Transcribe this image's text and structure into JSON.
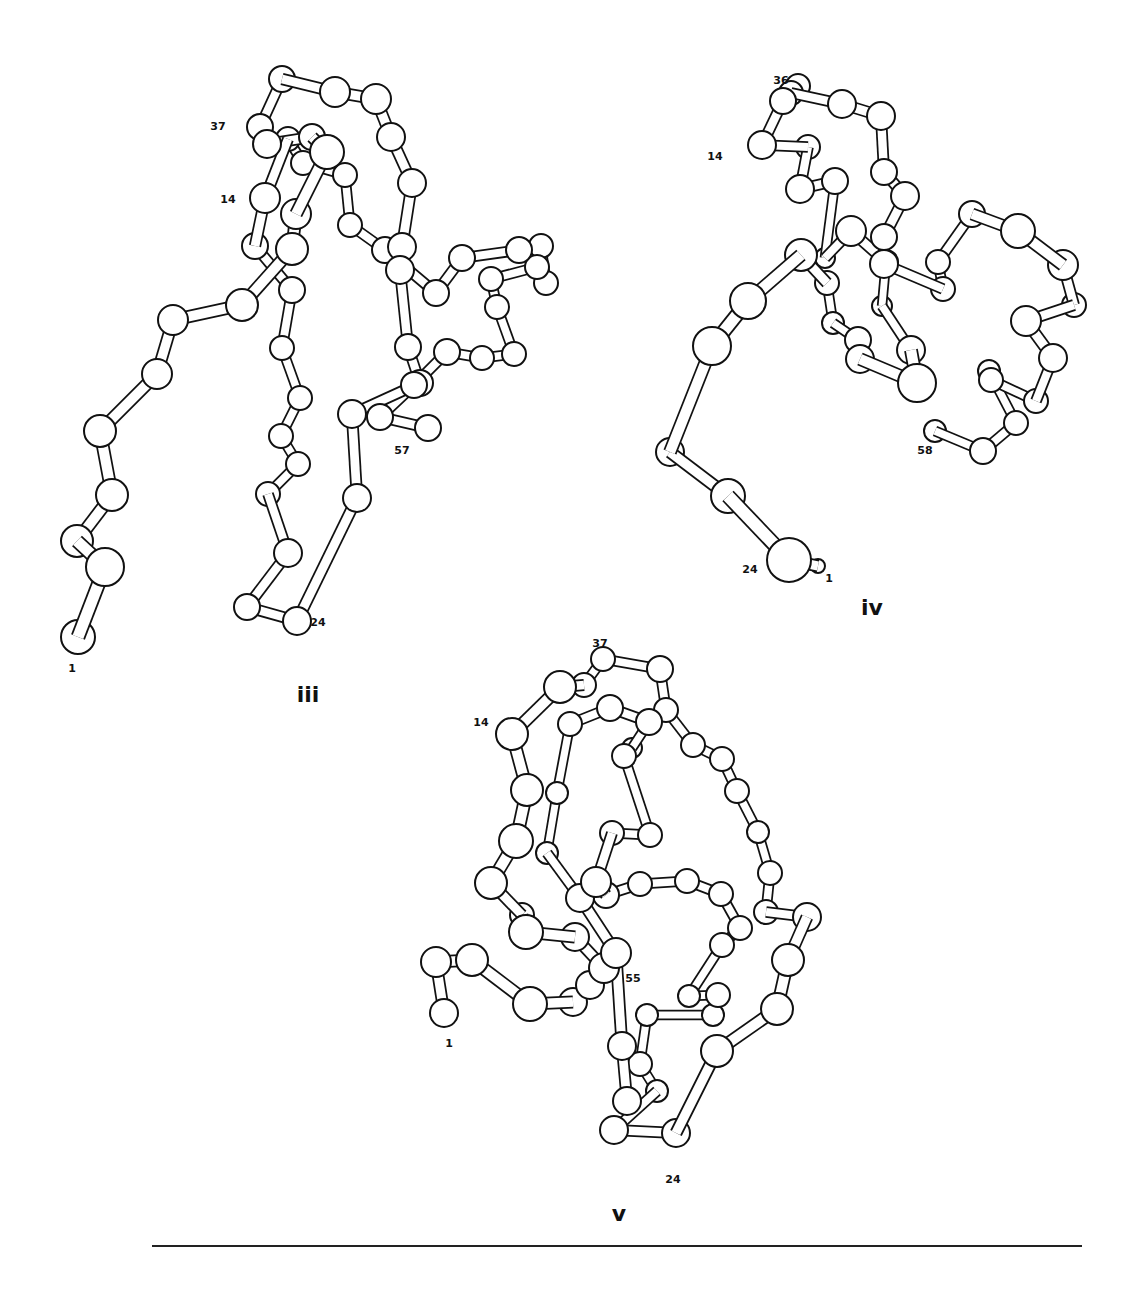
{
  "figure": {
    "panels": [
      {
        "id": "iii",
        "label": "iii",
        "label_pos": [
          308,
          702
        ],
        "residue_labels": [
          {
            "text": "1",
            "x": 72,
            "y": 672
          },
          {
            "text": "37",
            "x": 218,
            "y": 130
          },
          {
            "text": "14",
            "x": 228,
            "y": 203
          },
          {
            "text": "57",
            "x": 402,
            "y": 454
          },
          {
            "text": "24",
            "x": 318,
            "y": 626
          }
        ],
        "atoms": [
          [
            78,
            637,
            17
          ],
          [
            105,
            567,
            19
          ],
          [
            77,
            541,
            16
          ],
          [
            112,
            495,
            16
          ],
          [
            100,
            431,
            16
          ],
          [
            157,
            374,
            15
          ],
          [
            173,
            320,
            15
          ],
          [
            242,
            305,
            16
          ],
          [
            292,
            249,
            16
          ],
          [
            296,
            214,
            15
          ],
          [
            327,
            152,
            17
          ],
          [
            312,
            137,
            13
          ],
          [
            267,
            144,
            14
          ],
          [
            260,
            127,
            13
          ],
          [
            282,
            79,
            13
          ],
          [
            335,
            92,
            15
          ],
          [
            376,
            99,
            15
          ],
          [
            391,
            137,
            14
          ],
          [
            412,
            183,
            14
          ],
          [
            402,
            247,
            14
          ],
          [
            400,
            270,
            14
          ],
          [
            420,
            383,
            13
          ],
          [
            408,
            347,
            13
          ],
          [
            352,
            414,
            14
          ],
          [
            357,
            498,
            14
          ],
          [
            297,
            621,
            14
          ],
          [
            247,
            607,
            13
          ],
          [
            288,
            553,
            14
          ],
          [
            268,
            494,
            12
          ],
          [
            298,
            464,
            12
          ],
          [
            281,
            436,
            12
          ],
          [
            300,
            398,
            12
          ],
          [
            282,
            348,
            12
          ],
          [
            292,
            290,
            13
          ],
          [
            255,
            246,
            13
          ],
          [
            265,
            198,
            15
          ],
          [
            288,
            139,
            12
          ],
          [
            303,
            163,
            12
          ],
          [
            345,
            175,
            12
          ],
          [
            350,
            225,
            12
          ],
          [
            385,
            250,
            13
          ],
          [
            436,
            293,
            13
          ],
          [
            462,
            258,
            13
          ],
          [
            519,
            250,
            13
          ],
          [
            541,
            246,
            12
          ],
          [
            546,
            283,
            12
          ],
          [
            537,
            267,
            12
          ],
          [
            491,
            279,
            12
          ],
          [
            497,
            307,
            12
          ],
          [
            514,
            354,
            12
          ],
          [
            482,
            358,
            12
          ],
          [
            447,
            352,
            13
          ],
          [
            414,
            385,
            13
          ],
          [
            380,
            417,
            13
          ],
          [
            428,
            428,
            13
          ],
          [
            467,
            400,
            13
          ],
          [
            430,
            430,
            13
          ]
        ],
        "chain": [
          0,
          1,
          2,
          3,
          4,
          5,
          6,
          7,
          8,
          9,
          10,
          11,
          12,
          13,
          14,
          15,
          16,
          17,
          18,
          19,
          20,
          22,
          21,
          23,
          24,
          25,
          26,
          27,
          28,
          29,
          30,
          31,
          32,
          33,
          34,
          35,
          36,
          37,
          38,
          39,
          40,
          41,
          42,
          43,
          44,
          45,
          46,
          47,
          48,
          49,
          50,
          51,
          52,
          53,
          54
        ]
      },
      {
        "id": "iv",
        "label": "iv",
        "label_pos": [
          872,
          615
        ],
        "residue_labels": [
          {
            "text": "36",
            "x": 781,
            "y": 84
          },
          {
            "text": "14",
            "x": 715,
            "y": 160
          },
          {
            "text": "58",
            "x": 925,
            "y": 454
          },
          {
            "text": "24",
            "x": 750,
            "y": 573
          },
          {
            "text": "1",
            "x": 829,
            "y": 582
          }
        ],
        "atoms": [
          [
            818,
            566,
            7
          ],
          [
            789,
            560,
            22
          ],
          [
            728,
            496,
            17
          ],
          [
            670,
            452,
            14
          ],
          [
            712,
            346,
            19
          ],
          [
            748,
            301,
            18
          ],
          [
            801,
            255,
            16
          ],
          [
            827,
            283,
            12
          ],
          [
            833,
            323,
            11
          ],
          [
            858,
            340,
            13
          ],
          [
            860,
            359,
            14
          ],
          [
            917,
            383,
            19
          ],
          [
            911,
            350,
            14
          ],
          [
            882,
            306,
            10
          ],
          [
            886,
            262,
            12
          ],
          [
            851,
            231,
            15
          ],
          [
            825,
            258,
            10
          ],
          [
            835,
            181,
            13
          ],
          [
            800,
            189,
            14
          ],
          [
            808,
            147,
            12
          ],
          [
            762,
            145,
            14
          ],
          [
            783,
            101,
            13
          ],
          [
            798,
            86,
            12
          ],
          [
            791,
            93,
            12
          ],
          [
            842,
            104,
            14
          ],
          [
            881,
            116,
            14
          ],
          [
            884,
            172,
            13
          ],
          [
            905,
            196,
            14
          ],
          [
            884,
            237,
            13
          ],
          [
            884,
            264,
            14
          ],
          [
            943,
            289,
            12
          ],
          [
            938,
            262,
            12
          ],
          [
            972,
            214,
            13
          ],
          [
            1018,
            231,
            17
          ],
          [
            1063,
            265,
            15
          ],
          [
            1074,
            305,
            12
          ],
          [
            1026,
            321,
            15
          ],
          [
            1053,
            358,
            14
          ],
          [
            1036,
            401,
            12
          ],
          [
            991,
            380,
            12
          ],
          [
            989,
            371,
            11
          ],
          [
            1016,
            423,
            12
          ],
          [
            983,
            451,
            13
          ],
          [
            935,
            431,
            11
          ]
        ],
        "chain": [
          0,
          1,
          2,
          3,
          4,
          5,
          6,
          7,
          8,
          9,
          10,
          11,
          12,
          13,
          14,
          15,
          16,
          17,
          18,
          19,
          20,
          21,
          22,
          23,
          24,
          25,
          26,
          27,
          28,
          29,
          30,
          31,
          32,
          33,
          34,
          35,
          36,
          37,
          38,
          39,
          40,
          41,
          42,
          43
        ]
      },
      {
        "id": "v",
        "label": "v",
        "label_pos": [
          619,
          1221
        ],
        "residue_labels": [
          {
            "text": "37",
            "x": 600,
            "y": 647
          },
          {
            "text": "14",
            "x": 481,
            "y": 726
          },
          {
            "text": "55",
            "x": 633,
            "y": 982
          },
          {
            "text": "1",
            "x": 449,
            "y": 1047
          },
          {
            "text": "24",
            "x": 673,
            "y": 1183
          }
        ],
        "atoms": [
          [
            444,
            1013,
            14
          ],
          [
            436,
            962,
            15
          ],
          [
            472,
            960,
            16
          ],
          [
            530,
            1004,
            17
          ],
          [
            573,
            1002,
            14
          ],
          [
            590,
            985,
            14
          ],
          [
            604,
            968,
            15
          ],
          [
            575,
            937,
            14
          ],
          [
            526,
            932,
            17
          ],
          [
            522,
            915,
            12
          ],
          [
            491,
            883,
            16
          ],
          [
            516,
            841,
            17
          ],
          [
            527,
            790,
            16
          ],
          [
            512,
            734,
            16
          ],
          [
            560,
            687,
            16
          ],
          [
            584,
            685,
            12
          ],
          [
            603,
            659,
            12
          ],
          [
            660,
            669,
            13
          ],
          [
            666,
            710,
            12
          ],
          [
            693,
            745,
            12
          ],
          [
            722,
            759,
            12
          ],
          [
            737,
            791,
            12
          ],
          [
            758,
            832,
            11
          ],
          [
            770,
            873,
            12
          ],
          [
            766,
            912,
            12
          ],
          [
            807,
            917,
            14
          ],
          [
            788,
            960,
            16
          ],
          [
            777,
            1009,
            16
          ],
          [
            717,
            1051,
            16
          ],
          [
            676,
            1133,
            14
          ],
          [
            614,
            1130,
            14
          ],
          [
            657,
            1091,
            11
          ],
          [
            640,
            1064,
            12
          ],
          [
            647,
            1015,
            11
          ],
          [
            713,
            1015,
            11
          ],
          [
            718,
            995,
            12
          ],
          [
            689,
            996,
            11
          ],
          [
            722,
            945,
            12
          ],
          [
            740,
            928,
            12
          ],
          [
            721,
            894,
            12
          ],
          [
            687,
            881,
            12
          ],
          [
            640,
            884,
            12
          ],
          [
            606,
            895,
            13
          ],
          [
            596,
            882,
            15
          ],
          [
            612,
            833,
            12
          ],
          [
            650,
            835,
            12
          ],
          [
            624,
            756,
            12
          ],
          [
            632,
            748,
            10
          ],
          [
            649,
            722,
            13
          ],
          [
            610,
            708,
            13
          ],
          [
            570,
            724,
            12
          ],
          [
            557,
            793,
            11
          ],
          [
            547,
            853,
            11
          ],
          [
            580,
            898,
            14
          ],
          [
            616,
            953,
            15
          ],
          [
            622,
            1046,
            14
          ],
          [
            627,
            1101,
            14
          ]
        ],
        "chain": [
          0,
          1,
          2,
          3,
          4,
          5,
          6,
          7,
          8,
          9,
          10,
          11,
          12,
          13,
          14,
          15,
          16,
          17,
          18,
          19,
          20,
          21,
          22,
          23,
          24,
          25,
          26,
          27,
          28,
          29,
          30,
          31,
          32,
          33,
          34,
          35,
          36,
          37,
          38,
          39,
          40,
          41,
          42,
          43,
          44,
          45,
          46,
          47,
          48,
          49,
          50,
          51,
          52,
          53,
          54,
          55,
          56
        ]
      }
    ],
    "rule": {
      "x1": 152,
      "y1": 1246,
      "x2": 1082,
      "y2": 1246
    }
  }
}
